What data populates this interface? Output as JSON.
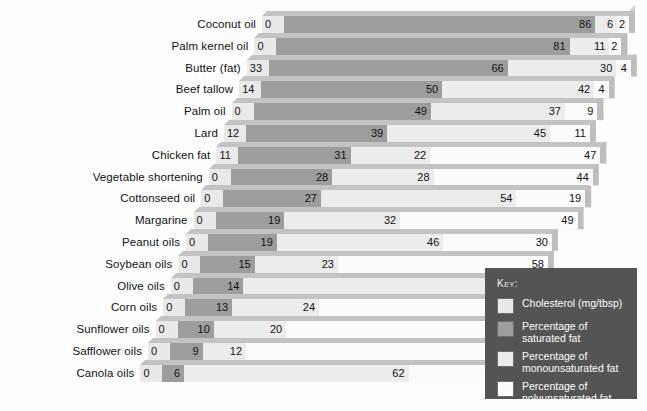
{
  "chart_data": {
    "type": "bar",
    "subtype": "stacked-horizontal-3d",
    "title": "",
    "xlabel": "",
    "ylabel": "",
    "grid": false,
    "legend_position": "bottom-right",
    "categories": [
      "Coconut oil",
      "Palm kernel oil",
      "Butter (fat)",
      "Beef tallow",
      "Palm oil",
      "Lard",
      "Chicken fat",
      "Vegetable shortening",
      "Cottonseed oil",
      "Margarine",
      "Peanut oils",
      "Soybean oils",
      "Olive oils",
      "Corn oils",
      "Sunflower oils",
      "Safflower oils",
      "Canola oils"
    ],
    "series": [
      {
        "name": "Cholesterol (mg/tbsp)",
        "color": "#e9e9e9",
        "values": [
          0,
          0,
          33,
          14,
          0,
          12,
          11,
          0,
          0,
          0,
          0,
          0,
          0,
          0,
          0,
          0,
          0
        ]
      },
      {
        "name": "Percentage of saturated fat",
        "color": "#9d9d9d",
        "values": [
          86,
          81,
          66,
          50,
          49,
          39,
          31,
          28,
          27,
          19,
          19,
          15,
          14,
          13,
          10,
          9,
          6
        ]
      },
      {
        "name": "Percentage of monounsaturated fat",
        "color": "#ececec",
        "values": [
          6,
          11,
          30,
          42,
          37,
          45,
          47,
          28,
          54,
          32,
          46,
          23,
          72,
          24,
          20,
          12,
          62
        ]
      },
      {
        "name": "Percentage of polyunsaturated fat",
        "color": "#fbfbfb",
        "values": [
          2,
          2,
          4,
          4,
          9,
          11,
          null,
          44,
          19,
          49,
          30,
          58,
          9,
          59,
          66,
          74,
          32
        ]
      }
    ]
  },
  "rows": [
    {
      "label": "Coconut oil",
      "chol": "0",
      "sat": "86",
      "mono": "6",
      "poly": "2"
    },
    {
      "label": "Palm kernel oil",
      "chol": "0",
      "sat": "81",
      "mono": "11",
      "poly": "2"
    },
    {
      "label": "Butter (fat)",
      "chol": "33",
      "sat": "66",
      "mono": "30",
      "poly": "4"
    },
    {
      "label": "Beef tallow",
      "chol": "14",
      "sat": "50",
      "mono": "42",
      "poly": "4"
    },
    {
      "label": "Palm oil",
      "chol": "0",
      "sat": "49",
      "mono": "37",
      "poly": "9"
    },
    {
      "label": "Lard",
      "chol": "12",
      "sat": "39",
      "mono": "45",
      "poly": "11"
    },
    {
      "label": "Chicken fat",
      "chol": "11",
      "sat": "31",
      "mono": "22",
      "poly": "47"
    },
    {
      "label": "Vegetable shortening",
      "chol": "0",
      "sat": "28",
      "mono": "28",
      "poly": "44"
    },
    {
      "label": "Cottonseed oil",
      "chol": "0",
      "sat": "27",
      "mono": "54",
      "poly": "19"
    },
    {
      "label": "Margarine",
      "chol": "0",
      "sat": "19",
      "mono": "32",
      "poly": "49"
    },
    {
      "label": "Peanut oils",
      "chol": "0",
      "sat": "19",
      "mono": "46",
      "poly": "30"
    },
    {
      "label": "Soybean oils",
      "chol": "0",
      "sat": "15",
      "mono": "23",
      "poly": "58"
    },
    {
      "label": "Olive oils",
      "chol": "0",
      "sat": "14",
      "mono": "72",
      "poly": "9"
    },
    {
      "label": "Corn oils",
      "chol": "0",
      "sat": "13",
      "mono": "24",
      "poly": "59"
    },
    {
      "label": "Sunflower oils",
      "chol": "0",
      "sat": "10",
      "mono": "20",
      "poly": "66"
    },
    {
      "label": "Safflower oils",
      "chol": "0",
      "sat": "9",
      "mono": "12",
      "poly": "74"
    },
    {
      "label": "Canola oils",
      "chol": "0",
      "sat": "6",
      "mono": "62",
      "poly": "32"
    }
  ],
  "legend": {
    "title": "Key:",
    "items": [
      {
        "label": "Cholesterol (mg/tbsp)",
        "color": "#e9e9e9"
      },
      {
        "label": "Percentage of\nsaturated fat",
        "color": "#9d9d9d"
      },
      {
        "label": "Percentage of\nmonounsaturated fat",
        "color": "#ececec"
      },
      {
        "label": "Percentage of\npolyunsaturated fat",
        "color": "#fbfbfb"
      }
    ]
  },
  "colors": {
    "background": "#fefefe",
    "slab": "#bdbdbd",
    "bevel": "#c3c3c3",
    "legend_panel": "#545454",
    "text": "#111111"
  }
}
